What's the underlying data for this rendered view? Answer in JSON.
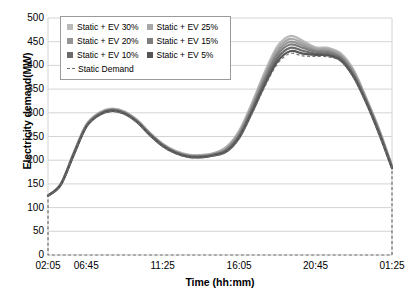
{
  "chart_data": {
    "type": "line",
    "title": "",
    "xlabel": "Time (hh:mm)",
    "ylabel": "Electricity demand(MW)",
    "ylim": [
      0,
      500
    ],
    "y_ticks": [
      0,
      50,
      100,
      150,
      200,
      250,
      300,
      350,
      400,
      450,
      500
    ],
    "x_ticks": [
      "02:05",
      "06:45",
      "11:25",
      "16:05",
      "20:45",
      "01:25"
    ],
    "grid": "horizontal",
    "legend_position": "upper-left-inside",
    "x": [
      "02:05",
      "03:40",
      "05:15",
      "06:45",
      "07:30",
      "08:15",
      "09:00",
      "09:45",
      "10:30",
      "11:25",
      "12:10",
      "13:00",
      "13:50",
      "14:40",
      "15:25",
      "16:05",
      "16:50",
      "17:35",
      "18:20",
      "19:05",
      "19:50",
      "20:45",
      "21:30",
      "22:15",
      "23:00",
      "23:45",
      "00:30",
      "01:25"
    ],
    "series": [
      {
        "name": "Static + EV 30%",
        "color": "#b9b9b9",
        "values": [
          125,
          150,
          215,
          275,
          300,
          309,
          303,
          285,
          258,
          235,
          220,
          212,
          211,
          215,
          228,
          262,
          320,
          385,
          440,
          462,
          452,
          438,
          437,
          425,
          390,
          330,
          265,
          188
        ]
      },
      {
        "name": "Static + EV 25%",
        "color": "#a8a8a8",
        "values": [
          125,
          150,
          214,
          274,
          299,
          308,
          302,
          284,
          257,
          234,
          219,
          211,
          210,
          214,
          226,
          259,
          316,
          380,
          434,
          456,
          447,
          435,
          434,
          422,
          387,
          328,
          263,
          187
        ]
      },
      {
        "name": "Static + EV 20%",
        "color": "#959595",
        "values": [
          125,
          149,
          213,
          273,
          298,
          307,
          301,
          283,
          256,
          233,
          218,
          210,
          209,
          213,
          224,
          256,
          312,
          375,
          428,
          450,
          442,
          432,
          431,
          419,
          384,
          326,
          261,
          186
        ]
      },
      {
        "name": "Static + EV 15%",
        "color": "#7e7e7e",
        "values": [
          125,
          149,
          212,
          272,
          297,
          306,
          300,
          282,
          255,
          232,
          217,
          209,
          208,
          212,
          222,
          253,
          308,
          370,
          422,
          444,
          437,
          429,
          428,
          416,
          381,
          324,
          259,
          185
        ]
      },
      {
        "name": "Static + EV 10%",
        "color": "#6b6b6b",
        "values": [
          125,
          148,
          211,
          271,
          296,
          305,
          299,
          281,
          254,
          231,
          216,
          208,
          207,
          211,
          220,
          250,
          304,
          364,
          415,
          437,
          431,
          425,
          424,
          413,
          378,
          322,
          257,
          184
        ]
      },
      {
        "name": "Static + EV 5%",
        "color": "#555555",
        "values": [
          125,
          148,
          210,
          270,
          295,
          304,
          298,
          280,
          253,
          230,
          215,
          207,
          206,
          210,
          218,
          247,
          300,
          358,
          408,
          430,
          425,
          422,
          421,
          410,
          375,
          320,
          255,
          183
        ]
      },
      {
        "name": "Static Demand",
        "color": "#6f6f6f",
        "style": "dashed",
        "values": [
          125,
          147,
          209,
          269,
          294,
          303,
          297,
          279,
          252,
          229,
          214,
          206,
          205,
          209,
          217,
          245,
          297,
          354,
          403,
          425,
          420,
          419,
          418,
          408,
          373,
          318,
          253,
          182
        ]
      }
    ],
    "baseline_annotation": {
      "description": "Static Demand dashed outline closes down to 0 MW at both ends and runs along the x axis",
      "start_value": 125,
      "end_value": 182,
      "baseline": 0
    }
  },
  "legend": {
    "rows": [
      [
        {
          "label": "Static + EV 30%",
          "marker": "square-swatch",
          "color": "#b9b9b9"
        },
        {
          "label": "Static + EV 25%",
          "marker": "square-swatch",
          "color": "#a8a8a8"
        }
      ],
      [
        {
          "label": "Static + EV 20%",
          "marker": "square-swatch",
          "color": "#959595"
        },
        {
          "label": "Static + EV 15%",
          "marker": "square-swatch",
          "color": "#7e7e7e"
        }
      ],
      [
        {
          "label": "Static + EV 10%",
          "marker": "square-swatch",
          "color": "#6b6b6b"
        },
        {
          "label": "Static + EV 5%",
          "marker": "square-swatch",
          "color": "#555555"
        }
      ],
      [
        {
          "label": "Static Demand",
          "marker": "dashed-line-glyph",
          "color": "#6f6f6f"
        }
      ]
    ]
  },
  "style": {
    "grid_color": "#d4d4d4",
    "axis_color": "#9a9a9a",
    "plot_background": "#ffffff",
    "text_color": "#000000"
  }
}
